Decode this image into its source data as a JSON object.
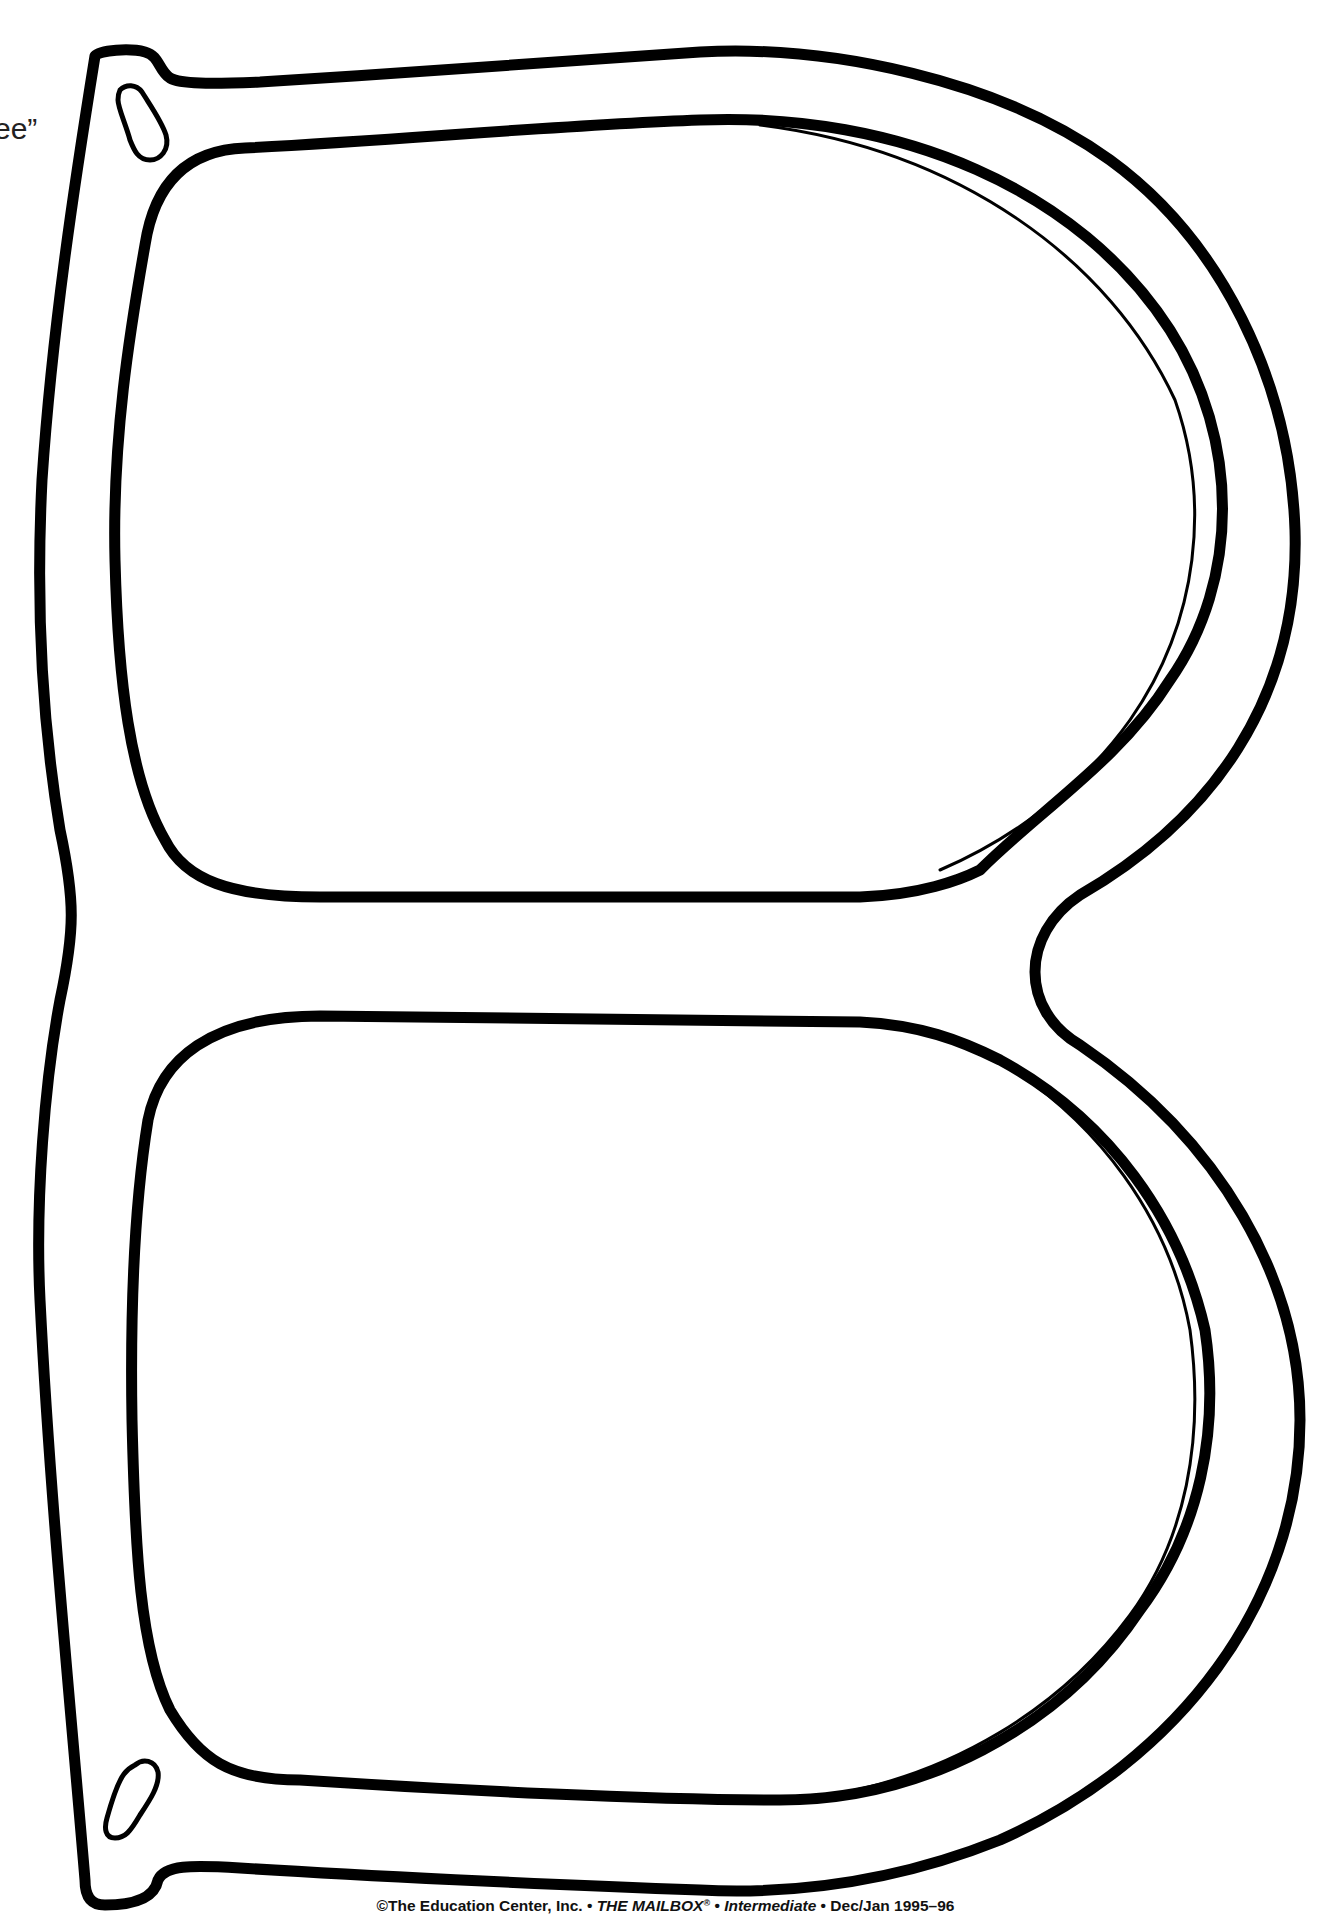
{
  "page": {
    "background": "#ffffff",
    "ink_color": "#000000"
  },
  "partial_text": "ee”",
  "illustration": {
    "subject": "eyeglasses-frame-cutout-template",
    "parts": [
      "outer-frame",
      "upper-lens",
      "lower-lens",
      "bridge",
      "hinge-slot-top",
      "hinge-slot-bottom"
    ]
  },
  "footer": {
    "copyright_prefix": "©The Education Center, Inc. • ",
    "publication": "THE MAILBOX",
    "registered": "®",
    "separator": " • ",
    "edition": "Intermediate",
    "date": " • Dec/Jan 1995–96"
  }
}
